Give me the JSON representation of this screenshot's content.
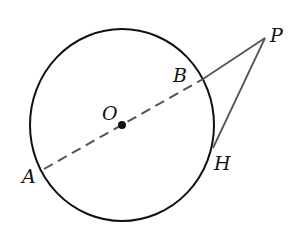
{
  "diagram": {
    "type": "geometry",
    "circle": {
      "center": "O",
      "cx": 122,
      "cy": 125,
      "rx": 92,
      "ry": 96
    },
    "points": {
      "O": {
        "label": "O",
        "x": 122,
        "y": 125
      },
      "A": {
        "label": "A",
        "x": 44,
        "y": 169
      },
      "B": {
        "label": "B",
        "x": 203,
        "y": 79
      },
      "P": {
        "label": "P",
        "x": 265,
        "y": 38
      },
      "H": {
        "label": "H",
        "x": 213,
        "y": 148
      }
    },
    "segments": [
      {
        "from": "A",
        "to": "B",
        "style": "dashed"
      },
      {
        "from": "B",
        "to": "P",
        "style": "solid"
      },
      {
        "from": "P",
        "to": "H",
        "style": "solid"
      }
    ],
    "colors": {
      "stroke": "#111111",
      "secant": "#555555"
    }
  }
}
